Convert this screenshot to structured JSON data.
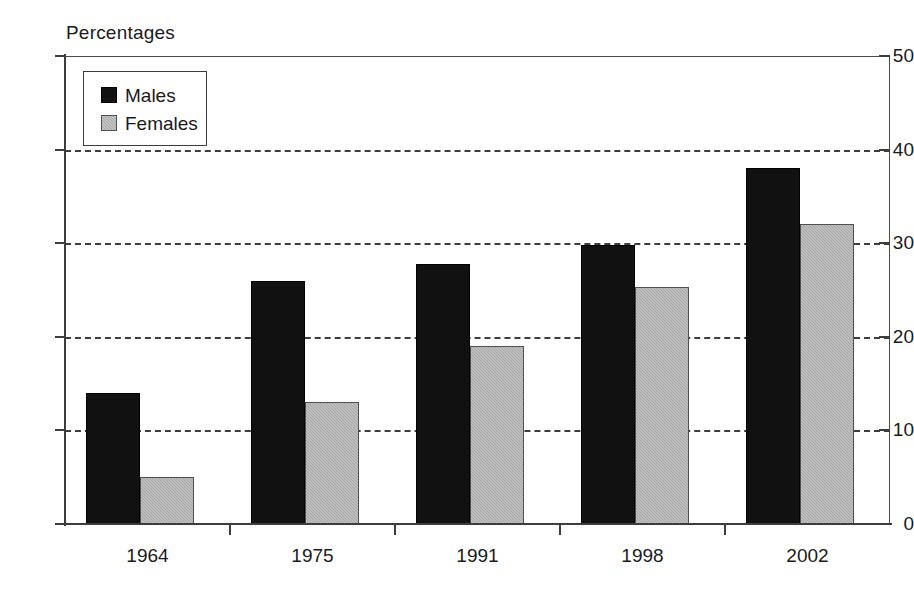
{
  "chart_data": {
    "type": "bar",
    "title": "",
    "subtitle": "",
    "axis_label_top": "Percentages",
    "xlabel": "",
    "ylabel": "Percentages",
    "categories": [
      "1964",
      "1975",
      "1991",
      "1998",
      "2002"
    ],
    "series": [
      {
        "name": "Males",
        "color": "#111111",
        "values": [
          14,
          26,
          27.8,
          29.8,
          38
        ]
      },
      {
        "name": "Females",
        "color": "#a9a9a9",
        "values": [
          5,
          13,
          19,
          25.3,
          32
        ]
      }
    ],
    "ylim": [
      0,
      50
    ],
    "ytick_values": [
      0,
      10,
      20,
      30,
      40,
      50
    ],
    "ytick_labels": [
      "0",
      "10",
      "20",
      "30",
      "40",
      "50"
    ],
    "gridline_values": [
      10,
      20,
      30,
      40
    ],
    "grid": "horizontal-dashed",
    "legend_position": "top-left-inside",
    "legend_entries": [
      "Males",
      "Females"
    ]
  },
  "legend": {
    "males_label": "Males",
    "females_label": "Females"
  },
  "axes": {
    "top_label": "Percentages"
  }
}
